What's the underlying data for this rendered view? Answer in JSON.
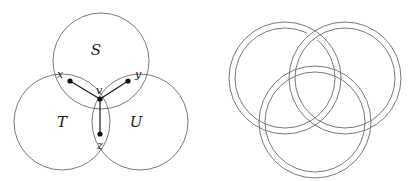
{
  "figure": {
    "panels": [
      {
        "id": "venn",
        "caption": ""
      },
      {
        "id": "rings",
        "caption": ""
      }
    ]
  },
  "colors": {
    "background": "#ffffff",
    "circle_stroke": "#585858",
    "ring_stroke": "#6a6a6a",
    "graph_stroke": "#1a1a1a",
    "node_fill": "#111111",
    "text": "#1a1a1a"
  },
  "venn": {
    "set_labels": [
      {
        "name": "S",
        "text": "S",
        "x": 96,
        "y": 51
      },
      {
        "name": "T",
        "text": "T",
        "x": 62,
        "y": 123
      },
      {
        "name": "U",
        "text": "U",
        "x": 136,
        "y": 123
      }
    ],
    "circles": [
      {
        "name": "S",
        "cx": 101,
        "cy": 61,
        "r": 48
      },
      {
        "name": "T",
        "cx": 62,
        "cy": 122,
        "r": 48
      },
      {
        "name": "U",
        "cx": 140,
        "cy": 122,
        "r": 48
      }
    ],
    "nodes": [
      {
        "name": "x",
        "label": "x",
        "cx": 70,
        "cy": 81,
        "r": 2.6,
        "label_x": 60,
        "label_y": 75
      },
      {
        "name": "y",
        "label": "y",
        "cx": 128,
        "cy": 81,
        "r": 2.6,
        "label_x": 138,
        "label_y": 75
      },
      {
        "name": "v",
        "label": "v",
        "cx": 100,
        "cy": 99,
        "r": 2.6,
        "label_x": 99,
        "label_y": 91
      },
      {
        "name": "z",
        "label": "z",
        "cx": 100,
        "cy": 134,
        "r": 2.6,
        "label_x": 100,
        "label_y": 146
      }
    ],
    "edges": [
      {
        "name": "edge-v-x",
        "from": "v",
        "to": "x",
        "x1": 100,
        "y1": 99,
        "x2": 70,
        "y2": 81
      },
      {
        "name": "edge-v-y",
        "from": "v",
        "to": "y",
        "x1": 100,
        "y1": 99,
        "x2": 128,
        "y2": 81
      },
      {
        "name": "edge-v-z",
        "from": "v",
        "to": "z",
        "x1": 100,
        "y1": 99,
        "x2": 100,
        "y2": 134
      }
    ]
  },
  "rings": {
    "count": 3,
    "description": "Borromean rings drawn as double-line annuli",
    "items": [
      {
        "name": "ring-upper-left",
        "cx": 285,
        "cy": 78,
        "r_outer": 56,
        "r_inner": 50
      },
      {
        "name": "ring-upper-right",
        "cx": 345,
        "cy": 78,
        "r_outer": 56,
        "r_inner": 50
      },
      {
        "name": "ring-lower",
        "cx": 315,
        "cy": 122,
        "r_outer": 56,
        "r_inner": 50
      }
    ]
  }
}
